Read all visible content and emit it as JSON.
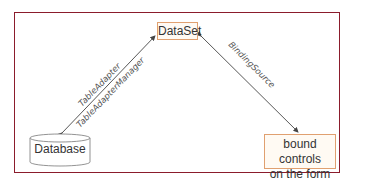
{
  "diagram": {
    "nodes": {
      "dataset": "DataSet",
      "database": "Database",
      "bound_controls_line1": "bound controls",
      "bound_controls_line2": "on the form"
    },
    "edges": {
      "table_adapter": "TableAdapter",
      "table_adapter_manager": "TableAdapterManager",
      "binding_source": "BindingSource"
    },
    "colors": {
      "frame": "#8b1c2c",
      "node_border": "#e0a070",
      "arrow": "#444444"
    }
  }
}
